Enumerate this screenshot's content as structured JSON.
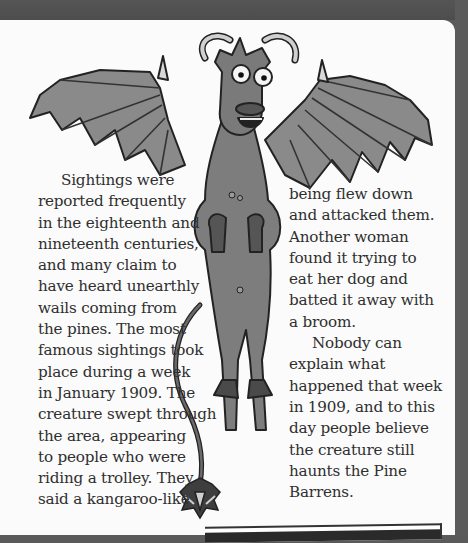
{
  "page": {
    "illustration": {
      "subject": "jersey-devil-creature",
      "description": "winged horned creature with bulging eyes, bat wings, hooved legs and long tail"
    },
    "left_column": {
      "paragraph_1_lines": [
        "Sightings were",
        "reported frequently",
        "in the eighteenth and",
        "nineteenth centuries,",
        "and many claim to",
        "have heard unearthly",
        "wails coming from",
        "the pines. The most",
        "famous sightings took",
        "place during a week",
        "in January 1909. The",
        "creature swept through",
        "the area, appearing",
        "to people who were",
        "riding a trolley. They",
        "said a kangaroo-like"
      ]
    },
    "right_column": {
      "paragraph_1_lines": [
        "being flew down",
        "and attacked them.",
        "Another woman",
        "found it trying to",
        "eat her dog and",
        "batted it away with",
        "a broom."
      ],
      "paragraph_2_lines": [
        "Nobody can",
        "explain what",
        "happened that week",
        "in 1909, and to this",
        "day people believe",
        "the creature still",
        "haunts the Pine",
        "Barrens."
      ]
    },
    "colors": {
      "page_background": "#fbfbfb",
      "border_gray": "#5a5a5a",
      "text": "#2f2f2f",
      "creature_body": "#7d7d7d",
      "creature_wing": "#8a8a8a",
      "outline": "#222222"
    }
  }
}
